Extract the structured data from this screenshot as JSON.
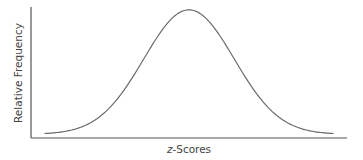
{
  "chart_data": {
    "type": "line",
    "title": "",
    "xlabel_prefix": "z",
    "xlabel_suffix": "-Scores",
    "xlabel": "z-Scores",
    "ylabel": "Relative Frequency",
    "xlim": [
      -3.5,
      3.5
    ],
    "ylim": [
      0,
      0.42
    ],
    "grid": false,
    "legend": "none",
    "series": [
      {
        "name": "Normal distribution",
        "distribution": "standard normal",
        "mean": 0,
        "sd": 1,
        "x_range": [
          -3.2,
          3.2
        ]
      }
    ]
  }
}
